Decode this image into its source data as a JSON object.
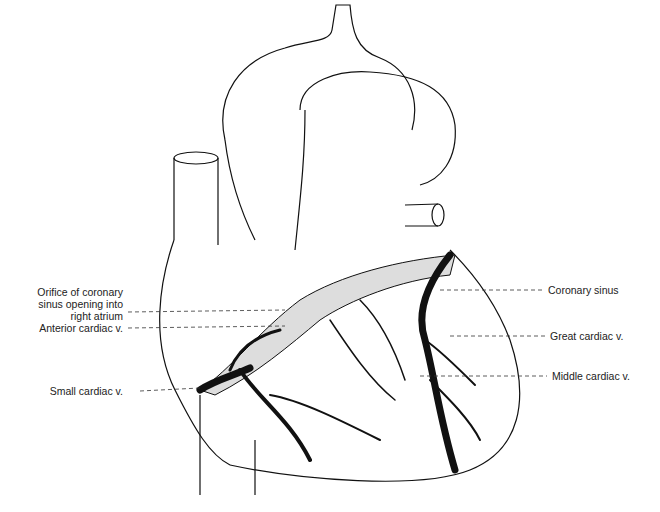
{
  "diagram": {
    "labels_left": [
      {
        "id": "orifice",
        "lines": [
          "Orifice of coronary",
          "sinus opening into",
          "right atrium"
        ]
      },
      {
        "id": "anterior",
        "lines": [
          "Anterior cardiac v."
        ]
      },
      {
        "id": "small",
        "lines": [
          "Small cardiac v."
        ]
      }
    ],
    "labels_right": [
      {
        "id": "sinus",
        "lines": [
          "Coronary sinus"
        ]
      },
      {
        "id": "great",
        "lines": [
          "Great cardiac v."
        ]
      },
      {
        "id": "middle",
        "lines": [
          "Middle cardiac v."
        ]
      }
    ]
  }
}
